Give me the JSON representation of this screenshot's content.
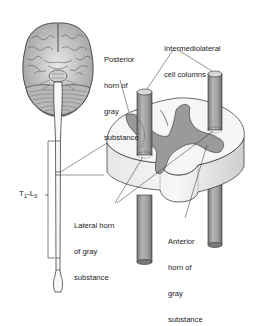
{
  "figure": {
    "colors": {
      "background": "#ffffff",
      "ink": "#1a1a1a",
      "gray_matter": "#9a9a9a",
      "white_matter": "#f4f4f4",
      "column_fill": "#a8a8a8",
      "brain_fill": "#d8d8d8"
    }
  },
  "labels": {
    "posterior_horn": [
      "Posterior",
      "horn of",
      "gray",
      "substance"
    ],
    "intermediolateral": [
      "Intermediolateral",
      "cell columns"
    ],
    "lateral_horn": [
      "Lateral horn",
      "of gray",
      "substance"
    ],
    "anterior_horn": [
      "Anterior",
      "horn of",
      "gray",
      "substance"
    ],
    "segment_range": {
      "t": "T",
      "t_sub": "1",
      "dash": "-",
      "l": "L",
      "l_sub": "3"
    }
  },
  "structures": {
    "brain": "brain-inferior-view",
    "spinal_cord": "spinal-cord-longitudinal",
    "cross_section": "spinal-cord-cross-section",
    "columns": [
      "left-intermediolateral-column",
      "right-intermediolateral-column"
    ]
  }
}
